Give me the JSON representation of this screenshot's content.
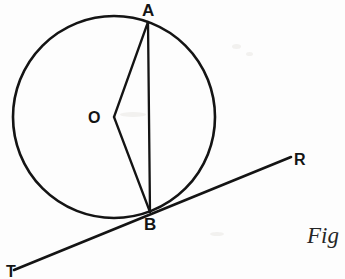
{
  "figure": {
    "caption": "Fig",
    "background_color": "#fdfdfd",
    "ink_color": "#141414"
  },
  "labels": {
    "apex_top": "A",
    "centre": "O",
    "tangent_point": "B",
    "tangent_right_end": "R",
    "tangent_left_end": "T"
  },
  "geometry": {
    "circle": {
      "center_x": 114,
      "center_y": 117,
      "radius": 101,
      "stroke_width": 2.6
    },
    "points": {
      "A": {
        "x": 148,
        "y": 22
      },
      "O": {
        "x": 114,
        "y": 117
      },
      "B": {
        "x": 150,
        "y": 212
      }
    },
    "segments": [
      {
        "name": "radius-OA",
        "x1": 114,
        "y1": 117,
        "x2": 148,
        "y2": 22
      },
      {
        "name": "radius-OB",
        "x1": 114,
        "y1": 117,
        "x2": 150,
        "y2": 212
      },
      {
        "name": "chord-AB",
        "x1": 148,
        "y1": 22,
        "x2": 150,
        "y2": 212
      }
    ],
    "tangent": {
      "name": "tangent-TR",
      "x1": 14,
      "y1": 270,
      "x2": 291,
      "y2": 157,
      "stroke_width": 2.6
    }
  }
}
